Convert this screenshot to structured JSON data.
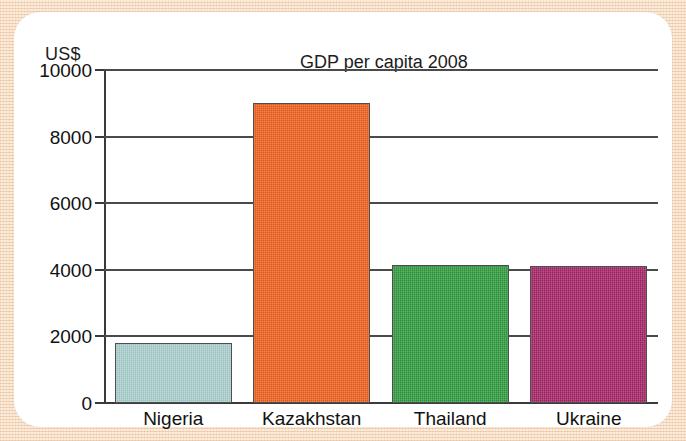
{
  "chart_data": {
    "type": "bar",
    "title": "GDP per capita 2008",
    "xlabel": "",
    "ylabel": "US$",
    "unit_label": "US$",
    "categories": [
      "Nigeria",
      "Kazakhstan",
      "Thailand",
      "Ukraine"
    ],
    "values": [
      1800,
      9000,
      4150,
      4100
    ],
    "ylim": [
      0,
      10000
    ],
    "ytick_labels": [
      "10000",
      "8000",
      "6000",
      "4000",
      "2000",
      "0"
    ],
    "yticks": [
      10000,
      8000,
      6000,
      4000,
      2000,
      0
    ],
    "grid": "horizontal",
    "legend": "none",
    "bar_colors": [
      "#a9cfcd",
      "#ef5f1e",
      "#2f9b3e",
      "#a52366"
    ],
    "bar_border_color": "#4e4e4e",
    "series": [
      {
        "name": "GDP per capita 2008",
        "points": [
          {
            "category": "Nigeria",
            "value": 1800,
            "color": "#a9cfcd"
          },
          {
            "category": "Kazakhstan",
            "value": 9000,
            "color": "#ef5f1e"
          },
          {
            "category": "Thailand",
            "value": 4150,
            "color": "#2f9b3e"
          },
          {
            "category": "Ukraine",
            "value": 4100,
            "color": "#a52366"
          }
        ]
      }
    ]
  },
  "theme": {
    "page_background": "#f5ddc5",
    "card_background": "#ffffff",
    "axis_color": "#3a3a3a",
    "gridline_color": "#4a4a4a",
    "text_color": "#111111"
  }
}
